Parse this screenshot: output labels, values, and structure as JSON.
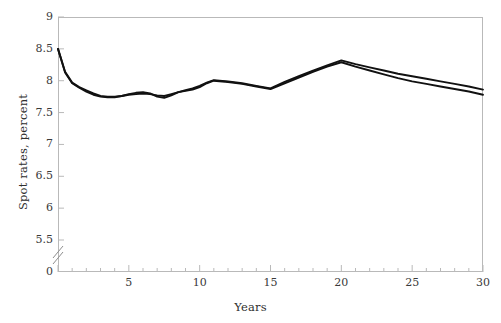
{
  "chart_data": {
    "type": "line",
    "title": "",
    "xlabel": "Years",
    "ylabel": "Spot rates, percent",
    "xlim": [
      0,
      30
    ],
    "ylim": [
      5.5,
      9
    ],
    "axis_break": true,
    "axis_break_label": "0",
    "grid": false,
    "legend": "none",
    "xticks": [
      0,
      5,
      10,
      15,
      20,
      25,
      30
    ],
    "xtick_labels": [
      "",
      "5",
      "10",
      "15",
      "20",
      "25",
      "30"
    ],
    "xminor_step": 1,
    "yticks": [
      5.5,
      6,
      6.5,
      7,
      7.5,
      8,
      8.5,
      9
    ],
    "ytick_labels": [
      "5.5",
      "6",
      "6.5",
      "7",
      "7.5",
      "8",
      "8.5",
      "9"
    ],
    "line_color": "#111111",
    "line_width": 1.9,
    "x": [
      0,
      0.5,
      1,
      1.5,
      2,
      2.5,
      3,
      3.5,
      4,
      4.5,
      5,
      5.5,
      6,
      6.5,
      7,
      7.5,
      8,
      8.5,
      9,
      9.5,
      10,
      10.5,
      11,
      12,
      13,
      14,
      15,
      16,
      17,
      18,
      19,
      20,
      21,
      22,
      23,
      24,
      25,
      26,
      27,
      28,
      29,
      30
    ],
    "series": [
      {
        "name": "series-1",
        "values": [
          8.5,
          8.14,
          7.97,
          7.9,
          7.85,
          7.8,
          7.76,
          7.75,
          7.75,
          7.76,
          7.78,
          7.79,
          7.8,
          7.79,
          7.77,
          7.76,
          7.79,
          7.82,
          7.84,
          7.86,
          7.9,
          7.96,
          8.0,
          7.98,
          7.95,
          7.91,
          7.87,
          7.96,
          8.05,
          8.14,
          8.22,
          8.29,
          8.22,
          8.16,
          8.1,
          8.04,
          7.99,
          7.95,
          7.91,
          7.87,
          7.83,
          7.78
        ]
      },
      {
        "name": "series-2",
        "values": [
          8.5,
          8.13,
          7.96,
          7.89,
          7.83,
          7.78,
          7.75,
          7.74,
          7.74,
          7.76,
          7.79,
          7.81,
          7.82,
          7.8,
          7.75,
          7.73,
          7.77,
          7.82,
          7.85,
          7.88,
          7.92,
          7.97,
          8.01,
          7.99,
          7.96,
          7.92,
          7.88,
          7.98,
          8.07,
          8.16,
          8.24,
          8.32,
          8.26,
          8.21,
          8.16,
          8.11,
          8.07,
          8.03,
          7.99,
          7.95,
          7.91,
          7.86
        ]
      }
    ]
  },
  "axis": {
    "y_title": "Spot rates, percent",
    "x_title": "Years",
    "zero_label": "0"
  }
}
